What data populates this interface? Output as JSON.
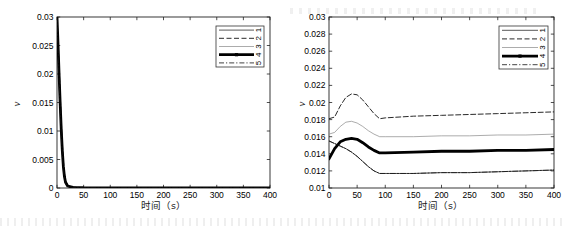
{
  "figure": {
    "panels": [
      {
        "id": "left",
        "name": "left-chart",
        "ylabel": "ν",
        "xlabel": "时间（s）",
        "xticks": [
          "0",
          "50",
          "100",
          "150",
          "200",
          "250",
          "300",
          "350",
          "400"
        ],
        "yticks": [
          "0",
          "0.005",
          "0.01",
          "0.015",
          "0.02",
          "0.025",
          "0.03"
        ]
      },
      {
        "id": "right",
        "name": "right-chart",
        "ylabel": "ν",
        "xlabel": "时间（s）",
        "xticks": [
          "0",
          "50",
          "100",
          "150",
          "200",
          "250",
          "300",
          "350",
          "400"
        ],
        "yticks": [
          "0.01",
          "0.012",
          "0.014",
          "0.016",
          "0.018",
          "0.02",
          "0.022",
          "0.024",
          "0.026",
          "0.028",
          "0.03"
        ]
      }
    ],
    "legend": {
      "name": "series-legend",
      "entries": [
        "1",
        "2",
        "3",
        "4",
        "5"
      ]
    }
  },
  "chart_data": [
    {
      "type": "line",
      "name": "left-chart",
      "title": "",
      "xlabel": "时间（s）",
      "ylabel": "ν",
      "xlim": [
        0,
        400
      ],
      "ylim": [
        0,
        0.03
      ],
      "xticks": [
        0,
        50,
        100,
        150,
        200,
        250,
        300,
        350,
        400
      ],
      "yticks": [
        0,
        0.005,
        0.01,
        0.015,
        0.02,
        0.025,
        0.03
      ],
      "grid": false,
      "legend_position": "upper right",
      "legend": [
        "1",
        "2",
        "3",
        "4",
        "5"
      ],
      "x": [
        0,
        2,
        4,
        6,
        8,
        10,
        12,
        14,
        16,
        20,
        30,
        50,
        100,
        150,
        200,
        250,
        300,
        350,
        400
      ],
      "series": [
        {
          "name": "1",
          "style": "solid-thin",
          "values": [
            0.03,
            0.0255,
            0.0201,
            0.0152,
            0.0106,
            0.0068,
            0.0039,
            0.0021,
            0.0011,
            0.0004,
            0.00012,
            5e-05,
            3e-05,
            3e-05,
            3e-05,
            3e-05,
            3e-05,
            3e-05,
            3e-05
          ]
        },
        {
          "name": "2",
          "style": "dashed",
          "values": [
            0.03,
            0.0262,
            0.0214,
            0.0166,
            0.0119,
            0.0079,
            0.0047,
            0.0026,
            0.0014,
            0.0005,
            0.00015,
            6e-05,
            3e-05,
            3e-05,
            3e-05,
            3e-05,
            3e-05,
            3e-05,
            3e-05
          ]
        },
        {
          "name": "3",
          "style": "solid-light",
          "values": [
            0.03,
            0.0248,
            0.0192,
            0.0142,
            0.0098,
            0.0062,
            0.0035,
            0.0019,
            0.0009,
            0.0003,
            0.0001,
            4e-05,
            2e-05,
            2e-05,
            2e-05,
            2e-05,
            2e-05,
            2e-05,
            2e-05
          ]
        },
        {
          "name": "4",
          "style": "thick-marker",
          "values": [
            0.03,
            0.0251,
            0.0197,
            0.0147,
            0.0102,
            0.0065,
            0.0037,
            0.002,
            0.001,
            0.00035,
            0.00011,
            4e-05,
            2e-05,
            2e-05,
            2e-05,
            2e-05,
            2e-05,
            2e-05,
            2e-05
          ]
        },
        {
          "name": "5",
          "style": "dash-dot",
          "values": [
            0.03,
            0.0244,
            0.0186,
            0.0136,
            0.0092,
            0.0057,
            0.0032,
            0.0017,
            0.0008,
            0.00028,
            9e-05,
            3e-05,
            2e-05,
            2e-05,
            2e-05,
            2e-05,
            2e-05,
            2e-05,
            2e-05
          ]
        }
      ]
    },
    {
      "type": "line",
      "name": "right-chart",
      "title": "",
      "xlabel": "时间（s）",
      "ylabel": "ν",
      "xlim": [
        0,
        400
      ],
      "ylim": [
        0.01,
        0.03
      ],
      "xticks": [
        0,
        50,
        100,
        150,
        200,
        250,
        300,
        350,
        400
      ],
      "yticks": [
        0.01,
        0.012,
        0.014,
        0.016,
        0.018,
        0.02,
        0.022,
        0.024,
        0.026,
        0.028,
        0.03
      ],
      "grid": false,
      "legend_position": "upper right",
      "legend": [
        "1",
        "2",
        "3",
        "4",
        "5"
      ],
      "x": [
        0,
        10,
        20,
        30,
        40,
        50,
        60,
        70,
        80,
        90,
        100,
        150,
        200,
        250,
        300,
        350,
        400
      ],
      "series": [
        {
          "name": "2",
          "style": "dashed",
          "values": [
            0.0181,
            0.0183,
            0.0196,
            0.0206,
            0.021,
            0.0209,
            0.0203,
            0.0195,
            0.0187,
            0.0181,
            0.0182,
            0.0184,
            0.0185,
            0.0186,
            0.0187,
            0.0188,
            0.0189
          ]
        },
        {
          "name": "3",
          "style": "solid-light",
          "values": [
            0.0163,
            0.0165,
            0.0172,
            0.0177,
            0.0178,
            0.0176,
            0.0172,
            0.0167,
            0.0163,
            0.016,
            0.016,
            0.016,
            0.0161,
            0.0161,
            0.0162,
            0.0162,
            0.0163
          ]
        },
        {
          "name": "4",
          "style": "thick-marker",
          "values": [
            0.0134,
            0.0146,
            0.0154,
            0.0157,
            0.0158,
            0.0157,
            0.0153,
            0.0148,
            0.0144,
            0.0141,
            0.0141,
            0.0142,
            0.0143,
            0.0143,
            0.0144,
            0.0144,
            0.0145
          ]
        },
        {
          "name": "1",
          "style": "solid-thin",
          "values": [
            0.0155,
            0.0152,
            0.0149,
            0.0146,
            0.0142,
            0.0137,
            0.0131,
            0.0125,
            0.012,
            0.0117,
            0.0117,
            0.0117,
            0.0118,
            0.0118,
            0.0119,
            0.012,
            0.0121
          ]
        },
        {
          "name": "5",
          "style": "dash-dot",
          "values": [
            0.0155,
            0.0152,
            0.0149,
            0.0146,
            0.0142,
            0.0137,
            0.0131,
            0.0125,
            0.012,
            0.0117,
            0.0117,
            0.0117,
            0.0118,
            0.0118,
            0.0119,
            0.012,
            0.0121
          ]
        }
      ]
    }
  ]
}
